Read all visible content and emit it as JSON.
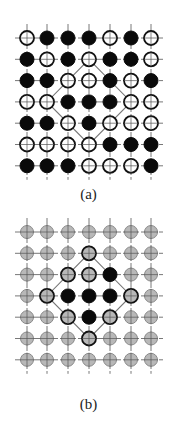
{
  "panels": [
    {
      "id": "a",
      "label": "(a)",
      "origin_y": 38,
      "grid": [
        [
          "open",
          "filled",
          "filled",
          "filled",
          "open",
          "filled",
          "open"
        ],
        [
          "filled",
          "open",
          "filled",
          "open",
          "filled",
          "filled",
          "open"
        ],
        [
          "filled",
          "filled",
          "open",
          "open",
          "filled",
          "open",
          "filled"
        ],
        [
          "open",
          "open",
          "filled",
          "filled",
          "filled",
          "open",
          "open"
        ],
        [
          "filled",
          "filled",
          "open",
          "filled",
          "open",
          "open",
          "open"
        ],
        [
          "open",
          "open",
          "open",
          "open",
          "filled",
          "filled",
          "filled"
        ],
        [
          "filled",
          "filled",
          "filled",
          "open",
          "open",
          "open",
          "filled"
        ]
      ],
      "diamond": {
        "top": [
          3,
          1
        ],
        "left": [
          1,
          3
        ],
        "bottom": [
          3,
          5
        ],
        "right": [
          5,
          3
        ]
      }
    },
    {
      "id": "b",
      "label": "(b)",
      "origin_y": 232,
      "grid": [
        [
          "gray",
          "gray",
          "gray",
          "gray",
          "gray",
          "gray",
          "gray"
        ],
        [
          "gray",
          "gray",
          "gray",
          "ring",
          "gray",
          "gray",
          "gray"
        ],
        [
          "gray",
          "gray",
          "ring",
          "ring",
          "filled",
          "gray",
          "gray"
        ],
        [
          "gray",
          "ring",
          "filled",
          "filled",
          "filled",
          "ring",
          "gray"
        ],
        [
          "gray",
          "gray",
          "ring",
          "filled",
          "ring",
          "gray",
          "gray"
        ],
        [
          "gray",
          "gray",
          "gray",
          "ring",
          "gray",
          "gray",
          "gray"
        ],
        [
          "gray",
          "gray",
          "gray",
          "gray",
          "gray",
          "gray",
          "gray"
        ]
      ],
      "diamond": {
        "top": [
          3,
          1
        ],
        "left": [
          1,
          3
        ],
        "bottom": [
          3,
          5
        ],
        "right": [
          5,
          3
        ]
      }
    }
  ],
  "colors": {
    "line": "#555555",
    "filled": "#0a0a0a",
    "open_stroke": "#111111",
    "gray_fill": "#b8b8b8",
    "gray_stroke": "#8a8a8a",
    "diamond": "#777777"
  },
  "layout": {
    "col_x": [
      27,
      47,
      68,
      89,
      110,
      131,
      151
    ],
    "spacing": 21.3,
    "radius": 7
  }
}
